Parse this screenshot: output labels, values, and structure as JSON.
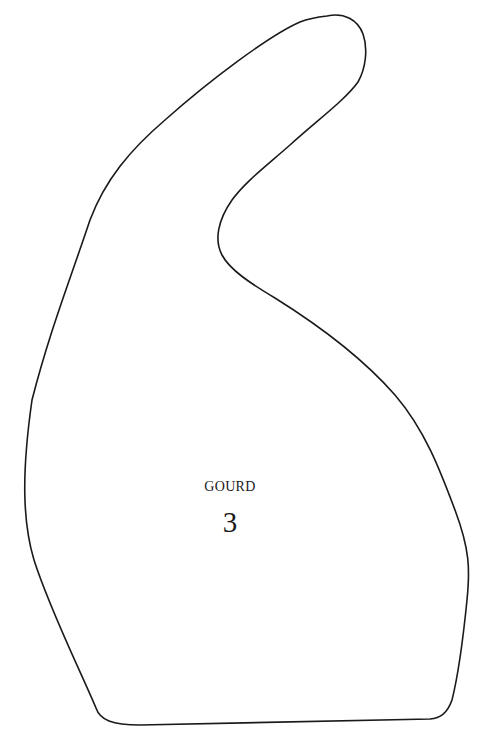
{
  "diagram": {
    "shape_name": "GOURD",
    "shape_number": "3",
    "outline_color": "#1a1a1a",
    "fill_color": "#ffffff"
  }
}
